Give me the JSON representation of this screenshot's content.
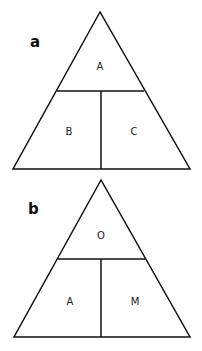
{
  "diagrams": [
    {
      "panel_label": "a",
      "top_label": "A",
      "bottom_left_label": "B",
      "bottom_right_label": "C"
    },
    {
      "panel_label": "b",
      "top_label": "O",
      "bottom_left_label": "A",
      "bottom_right_label": "M"
    }
  ],
  "colors": {
    "line": "#111111",
    "background": "#ffffff"
  }
}
